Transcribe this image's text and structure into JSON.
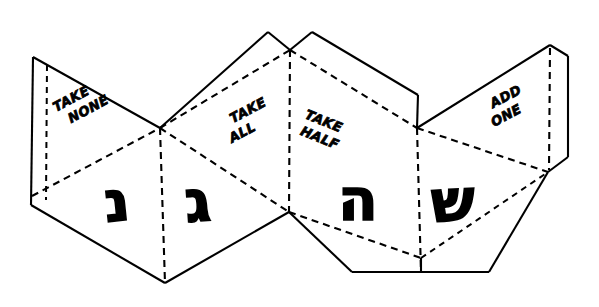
{
  "document": {
    "type": "papercraft-net",
    "subject": "dreidel",
    "ink_color": "#000000",
    "paper_color": "#ffffff"
  },
  "panels": [
    {
      "id": "panel-nun",
      "label_line1": "TAKE",
      "label_line2": "NONE",
      "hebrew_letter": "נ",
      "hebrew_name": "nun",
      "label_rotation": "-28",
      "letter_rotation": "0"
    },
    {
      "id": "panel-gimel",
      "label_line1": "TAKE",
      "label_line2": "ALL",
      "hebrew_letter": "ג",
      "hebrew_name": "gimel",
      "label_rotation": "-28",
      "letter_rotation": "0"
    },
    {
      "id": "panel-hey",
      "label_line1": "TAKE",
      "label_line2": "HALF",
      "hebrew_letter": "ה",
      "hebrew_name": "hey",
      "label_rotation": "22",
      "letter_rotation": "0"
    },
    {
      "id": "panel-shin",
      "label_line1": "ADD",
      "label_line2": "ONE",
      "hebrew_letter": "ש",
      "hebrew_name": "shin",
      "label_rotation": "-28",
      "letter_rotation": "0"
    }
  ]
}
